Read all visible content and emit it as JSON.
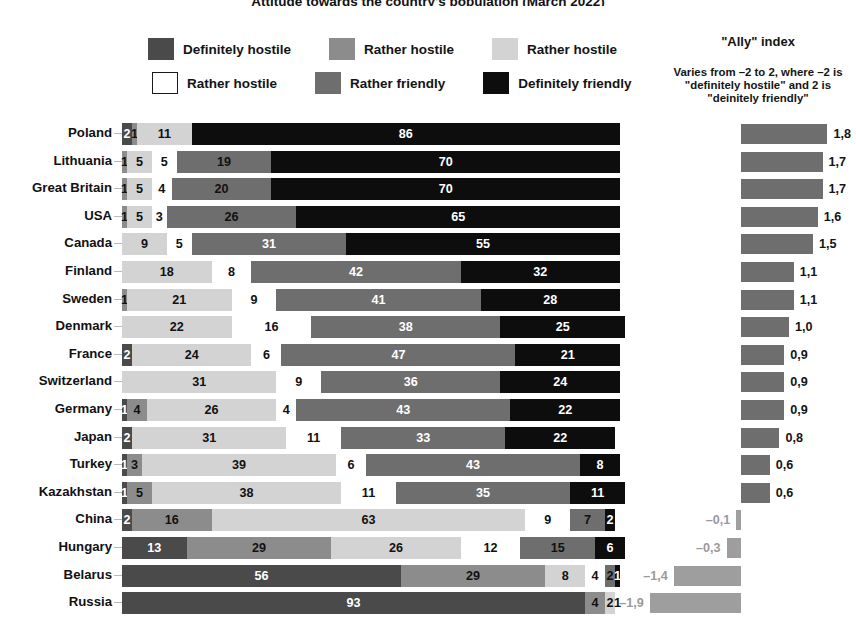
{
  "title": "Attitude towards the country's population (March 2022)",
  "legend": {
    "rows": [
      [
        {
          "label": "Definitely hostile",
          "color": "#4a4a4a",
          "border": false
        },
        {
          "label": "Rather hostile",
          "color": "#8c8c8c",
          "border": false
        },
        {
          "label": "Rather hostile",
          "color": "#d3d3d3",
          "border": false
        }
      ],
      [
        {
          "label": "Rather hostile",
          "color": "#ffffff",
          "border": true
        },
        {
          "label": "Rather friendly",
          "color": "#6e6e6e",
          "border": false
        },
        {
          "label": "Definitely friendly",
          "color": "#0d0d0d",
          "border": false
        }
      ]
    ]
  },
  "ally_panel": {
    "title": "\"Ally\" index",
    "note": "Varies from –2 to 2, where –2 is \"definitely hostile\" and 2 is \"deinitely friendly\""
  },
  "palette": {
    "definitely_hostile": "#4a4a4a",
    "rather_hostile_mid": "#8c8c8c",
    "rather_hostile_light": "#d3d3d3",
    "rather_hostile_white": "#ffffff",
    "rather_friendly": "#6e6e6e",
    "definitely_friendly": "#0d0d0d",
    "ally_bar": "#6e6e6e",
    "ally_neg_text": "#9a9a9a"
  },
  "chart_data": {
    "type": "bar",
    "subtype": "stacked-horizontal-100pct",
    "title": "Attitude towards the country's population (March 2022)",
    "xlabel": "",
    "ylabel": "",
    "xlim": [
      0,
      100
    ],
    "grid": false,
    "legend_position": "top",
    "series": [
      {
        "name": "Definitely hostile",
        "color": "#4a4a4a"
      },
      {
        "name": "Rather hostile",
        "color": "#8c8c8c"
      },
      {
        "name": "Rather hostile",
        "color": "#d3d3d3"
      },
      {
        "name": "Rather hostile",
        "color": "#ffffff"
      },
      {
        "name": "Rather friendly",
        "color": "#6e6e6e"
      },
      {
        "name": "Definitely friendly",
        "color": "#0d0d0d"
      }
    ],
    "categories": [
      "Poland",
      "Lithuania",
      "Great Britain",
      "USA",
      "Canada",
      "Finland",
      "Sweden",
      "Denmark",
      "France",
      "Switzerland",
      "Germany",
      "Japan",
      "Turkey",
      "Kazakhstan",
      "China",
      "Hungary",
      "Belarus",
      "Russia"
    ],
    "rows": [
      {
        "country": "Poland",
        "values": [
          2,
          1,
          11,
          0,
          0,
          86
        ],
        "ally": 1.8,
        "ally_label": "1,8"
      },
      {
        "country": "Lithuania",
        "values": [
          0,
          1,
          5,
          5,
          19,
          70
        ],
        "ally": 1.7,
        "ally_label": "1,7"
      },
      {
        "country": "Great Britain",
        "values": [
          0,
          1,
          5,
          4,
          20,
          70
        ],
        "ally": 1.7,
        "ally_label": "1,7"
      },
      {
        "country": "USA",
        "values": [
          0,
          1,
          5,
          3,
          26,
          65
        ],
        "ally": 1.6,
        "ally_label": "1,6"
      },
      {
        "country": "Canada",
        "values": [
          0,
          0,
          9,
          5,
          31,
          55
        ],
        "ally": 1.5,
        "ally_label": "1,5"
      },
      {
        "country": "Finland",
        "values": [
          0,
          0,
          18,
          8,
          42,
          32
        ],
        "ally": 1.1,
        "ally_label": "1,1"
      },
      {
        "country": "Sweden",
        "values": [
          0,
          1,
          21,
          9,
          41,
          28
        ],
        "ally": 1.1,
        "ally_label": "1,1"
      },
      {
        "country": "Denmark",
        "values": [
          0,
          0,
          22,
          16,
          38,
          25
        ],
        "ally": 1.0,
        "ally_label": "1,0"
      },
      {
        "country": "France",
        "values": [
          2,
          0,
          24,
          6,
          47,
          21
        ],
        "ally": 0.9,
        "ally_label": "0,9"
      },
      {
        "country": "Switzerland",
        "values": [
          0,
          0,
          31,
          9,
          36,
          24
        ],
        "ally": 0.9,
        "ally_label": "0,9"
      },
      {
        "country": "Germany",
        "values": [
          1,
          4,
          26,
          4,
          43,
          22
        ],
        "ally": 0.9,
        "ally_label": "0,9"
      },
      {
        "country": "Japan",
        "values": [
          2,
          0,
          31,
          11,
          33,
          22
        ],
        "ally": 0.8,
        "ally_label": "0,8"
      },
      {
        "country": "Turkey",
        "values": [
          1,
          3,
          39,
          6,
          43,
          8
        ],
        "ally": 0.6,
        "ally_label": "0,6"
      },
      {
        "country": "Kazakhstan",
        "values": [
          1,
          5,
          38,
          11,
          35,
          11
        ],
        "ally": 0.6,
        "ally_label": "0,6"
      },
      {
        "country": "China",
        "values": [
          2,
          16,
          63,
          9,
          7,
          2
        ],
        "ally": -0.1,
        "ally_label": "–0,1"
      },
      {
        "country": "Hungary",
        "values": [
          13,
          29,
          26,
          12,
          15,
          6
        ],
        "ally": -0.3,
        "ally_label": "–0,3"
      },
      {
        "country": "Belarus",
        "values": [
          56,
          29,
          8,
          4,
          2,
          1
        ],
        "ally": -1.4,
        "ally_label": "–1,4"
      },
      {
        "country": "Russia",
        "values": [
          93,
          4,
          2,
          1,
          0,
          0
        ],
        "ally": -1.9,
        "ally_label": "–1,9"
      }
    ]
  }
}
